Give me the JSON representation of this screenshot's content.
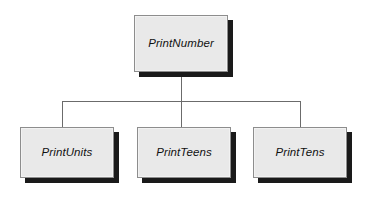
{
  "diagram": {
    "type": "structure-chart",
    "title": "",
    "background_color": "#ffffff",
    "node_fill_color": "#e9e9e9",
    "node_border_color": "#8d8d8d",
    "node_shadow_color": "#1a1a1a",
    "connector_color": "#6b6b6b",
    "root": {
      "id": "print-number",
      "label": "PrintNumber"
    },
    "children": [
      {
        "id": "print-units",
        "label": "PrintUnits"
      },
      {
        "id": "print-teens",
        "label": "PrintTeens"
      },
      {
        "id": "print-tens",
        "label": "PrintTens"
      }
    ]
  }
}
